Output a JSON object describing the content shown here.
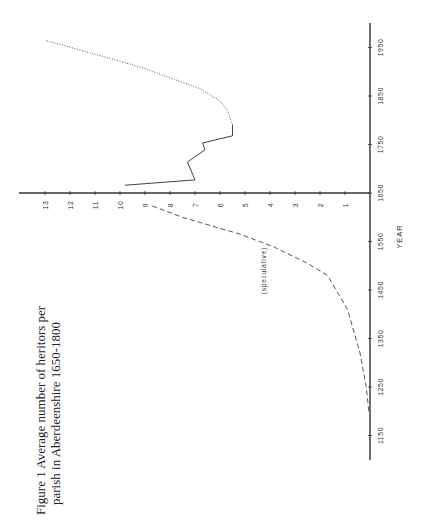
{
  "figure": {
    "title_line1": "Figure 1   Average number of heritors per",
    "title_line2": "parish in Aberdeenshire 1650-1800"
  },
  "chart_data": {
    "type": "line",
    "title": "Figure 1 Average number of heritors per parish in Aberdeenshire 1650-1800",
    "xlabel": "YEAR",
    "ylabel": "",
    "orientation": "rotated 90° counterclockwise (year axis vertical on right, values horizontal)",
    "xlim": [
      1100,
      1980
    ],
    "ylim": [
      0,
      13.5
    ],
    "x_ticks": [
      1150,
      1250,
      1350,
      1450,
      1550,
      1650,
      1750,
      1850,
      1950
    ],
    "y_ticks": [
      1,
      2,
      3,
      4,
      5,
      6,
      7,
      8,
      9,
      10,
      11,
      12,
      13
    ],
    "grid": false,
    "legend": null,
    "annotations": [
      {
        "text": "(speculative)",
        "near_series": "speculative",
        "x": 1490,
        "y": 4.1
      }
    ],
    "series": [
      {
        "name": "speculative",
        "style": "dashed",
        "x": [
          1200,
          1250,
          1320,
          1410,
          1480,
          1505,
          1540,
          1565,
          1600,
          1625
        ],
        "y": [
          0.05,
          0.15,
          0.4,
          0.9,
          1.7,
          2.5,
          3.9,
          5.2,
          7.5,
          8.8
        ]
      },
      {
        "name": "recorded",
        "style": "solid",
        "x": [
          1666,
          1677,
          1714,
          1739,
          1753,
          1768,
          1790
        ],
        "y": [
          9.8,
          7.0,
          7.3,
          6.6,
          6.7,
          5.5,
          5.5
        ]
      },
      {
        "name": "later",
        "style": "dotted",
        "x": [
          1790,
          1820,
          1840,
          1865,
          1910,
          1965
        ],
        "y": [
          5.5,
          5.7,
          6.0,
          6.8,
          9.2,
          13.0
        ]
      }
    ]
  },
  "layout": {
    "value_zero_px": 370,
    "px_per_value": 25,
    "year_ref": 1650,
    "year_ref_px": 193,
    "px_per_year": 0.485,
    "axis_value_px_start": 19,
    "axis_year_px_top": 23,
    "axis_year_px_bottom": 460,
    "ink": "#333333"
  }
}
